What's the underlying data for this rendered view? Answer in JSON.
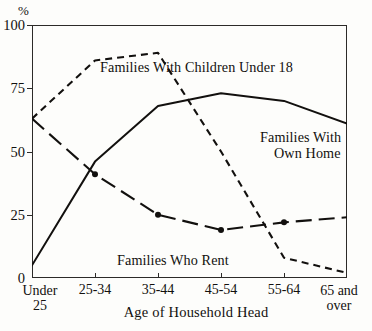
{
  "chart_data": {
    "type": "line",
    "title": "",
    "xlabel": "Age of Household Head",
    "ylabel": "%",
    "ylim": [
      0,
      100
    ],
    "yticks": [
      0,
      25,
      50,
      75,
      100
    ],
    "ytick_labels": [
      "0",
      "25",
      "50",
      "75",
      "100"
    ],
    "grid": false,
    "legend": "inline annotations",
    "categories": [
      "Under 25",
      "25-34",
      "35-44",
      "45-54",
      "55-64",
      "65 and over"
    ],
    "category_lines": [
      [
        "Under",
        "25"
      ],
      [
        "25-34"
      ],
      [
        "35-44"
      ],
      [
        "45-54"
      ],
      [
        "55-64"
      ],
      [
        "65 and",
        "over"
      ]
    ],
    "series": [
      {
        "name": "Families With Children Under 18",
        "style": "dashed",
        "markers": false,
        "values": [
          63,
          86,
          89,
          50,
          8,
          2
        ]
      },
      {
        "name": "Families With Own Home",
        "style": "solid",
        "markers": false,
        "values": [
          5,
          46,
          68,
          73,
          70,
          61
        ]
      },
      {
        "name": "Families Who Rent",
        "style": "long-dash",
        "markers": true,
        "values": [
          63,
          41,
          25,
          19,
          22,
          24
        ]
      }
    ],
    "annotations": [
      {
        "id": "children",
        "text": "Families With Children Under 18"
      },
      {
        "id": "ownhome",
        "line1": "Families With",
        "line2": "Own Home"
      },
      {
        "id": "rent",
        "text": "Families Who Rent"
      }
    ],
    "colors": {
      "ink": "#12100e",
      "axis": "#2c2a28",
      "background": "#fdfdfb"
    }
  }
}
